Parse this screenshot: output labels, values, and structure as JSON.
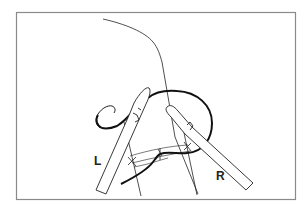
{
  "figure": {
    "labels": {
      "left_instrument": "L",
      "right_instrument": "R"
    },
    "colors": {
      "line": "#222222",
      "frame": "#7a7a7a",
      "background": "#ffffff"
    }
  }
}
